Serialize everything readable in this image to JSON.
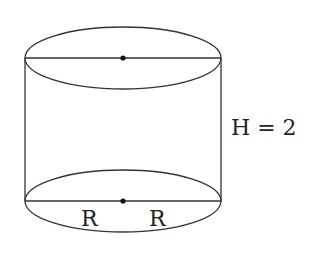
{
  "diagram": {
    "type": "cylinder",
    "colors": {
      "stroke": "#333333",
      "text": "#222222",
      "background": "#ffffff"
    },
    "labels": {
      "height": "H = 2",
      "radius_left": "R",
      "radius_right": "R"
    },
    "elements": {
      "top_ellipse": {
        "cx": 123,
        "cy": 58,
        "rx": 98,
        "ry": 31
      },
      "bottom_ellipse": {
        "cx": 123,
        "cy": 201,
        "rx": 98,
        "ry": 31
      },
      "top_center_point": {
        "x": 123,
        "y": 58
      },
      "bottom_center_point": {
        "x": 123,
        "y": 201
      }
    }
  }
}
